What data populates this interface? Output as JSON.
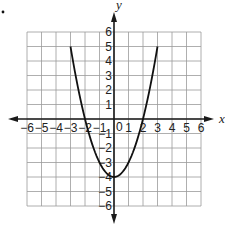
{
  "chart_data": {
    "type": "line",
    "title": "",
    "xlabel": "x",
    "ylabel": "y",
    "xlim": [
      -6,
      6
    ],
    "ylim": [
      -6,
      6
    ],
    "grid": true,
    "x_ticks": [
      -6,
      -5,
      -4,
      -3,
      -2,
      -1,
      1,
      2,
      3,
      4,
      5,
      6
    ],
    "y_ticks": [
      6,
      5,
      4,
      3,
      2,
      1,
      -1,
      -2,
      -3,
      -4,
      -5,
      -6
    ],
    "origin_label": "0",
    "x_tick_labels": [
      "−6",
      "−5",
      "−4",
      "−3",
      "−2",
      "−1",
      "1",
      "2",
      "3",
      "4",
      "5",
      "6"
    ],
    "y_tick_labels": [
      "6",
      "5",
      "4",
      "3",
      "2",
      "1",
      "−1",
      "−2",
      "−3",
      "−4",
      "−5",
      "−6"
    ],
    "series": [
      {
        "name": "parabola",
        "equation": "y = x^2 - 4",
        "domain": [
          -3,
          3
        ],
        "x": [
          -3,
          -2.5,
          -2,
          -1.5,
          -1,
          -0.5,
          0,
          0.5,
          1,
          1.5,
          2,
          2.5,
          3
        ],
        "y": [
          5,
          2.25,
          0,
          -1.75,
          -3,
          -3.75,
          -4,
          -3.75,
          -3,
          -1.75,
          0,
          2.25,
          5
        ]
      }
    ]
  }
}
